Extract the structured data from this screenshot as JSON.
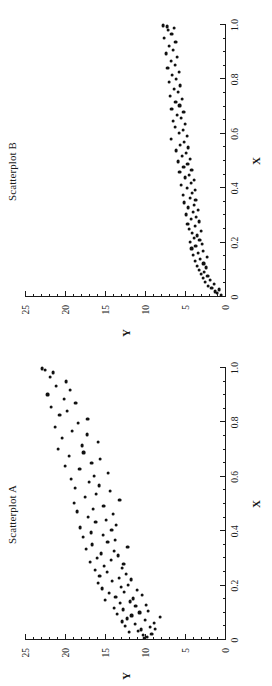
{
  "figure": {
    "background": "#ffffff",
    "ink": "#1a1a1a",
    "point_color": "#111111",
    "orientation": "rotated-90-ccw"
  },
  "panels": [
    {
      "id": "scatterplot-b",
      "title": "Scatterplot B",
      "xlabel": "X",
      "ylabel": "Y"
    },
    {
      "id": "scatterplot-a",
      "title": "Scatterplot A",
      "xlabel": "X",
      "ylabel": "Y"
    }
  ],
  "axis": {
    "x_ticklabels": [
      "0",
      "0.2",
      "0.4",
      "0.6",
      "0.8",
      "1.0"
    ],
    "x_tickvalues": [
      0,
      0.2,
      0.4,
      0.6,
      0.8,
      1.0
    ],
    "y_ticklabels": [
      "0",
      "5",
      "10",
      "15",
      "20",
      "25"
    ],
    "y_tickvalues": [
      0,
      5,
      10,
      15,
      20,
      25
    ],
    "xlim": [
      0,
      1.0
    ],
    "ylim": [
      0,
      25
    ],
    "x_minor_step": 0.05,
    "y_minor_step": 1
  },
  "chart_data": [
    {
      "type": "scatter",
      "title": "Scatterplot A",
      "xlabel": "X",
      "ylabel": "Y",
      "xlim": [
        0,
        1.0
      ],
      "ylim": [
        0,
        25
      ],
      "grid": false,
      "legend": null,
      "x": [
        0.008,
        0.012,
        0.018,
        0.022,
        0.028,
        0.033,
        0.038,
        0.041,
        0.047,
        0.052,
        0.058,
        0.062,
        0.068,
        0.073,
        0.079,
        0.084,
        0.09,
        0.095,
        0.101,
        0.107,
        0.112,
        0.118,
        0.124,
        0.129,
        0.135,
        0.141,
        0.147,
        0.152,
        0.158,
        0.164,
        0.171,
        0.177,
        0.183,
        0.189,
        0.196,
        0.203,
        0.209,
        0.216,
        0.222,
        0.229,
        0.236,
        0.243,
        0.25,
        0.257,
        0.264,
        0.272,
        0.279,
        0.287,
        0.294,
        0.302,
        0.31,
        0.318,
        0.326,
        0.334,
        0.343,
        0.351,
        0.36,
        0.368,
        0.377,
        0.386,
        0.395,
        0.404,
        0.413,
        0.423,
        0.432,
        0.442,
        0.452,
        0.462,
        0.472,
        0.482,
        0.492,
        0.503,
        0.513,
        0.524,
        0.535,
        0.546,
        0.557,
        0.568,
        0.58,
        0.591,
        0.603,
        0.615,
        0.627,
        0.639,
        0.651,
        0.664,
        0.676,
        0.689,
        0.702,
        0.715,
        0.728,
        0.742,
        0.755,
        0.769,
        0.783,
        0.797,
        0.812,
        0.826,
        0.841,
        0.856,
        0.871,
        0.886,
        0.902,
        0.918,
        0.934,
        0.95,
        0.966,
        0.983,
        0.992,
        0.998
      ],
      "y": [
        10.2,
        9.9,
        10.4,
        9.3,
        12.1,
        11.0,
        10.6,
        8.9,
        9.5,
        12.6,
        11.4,
        9.0,
        13.0,
        10.1,
        12.4,
        8.2,
        11.8,
        13.6,
        10.8,
        9.7,
        12.9,
        14.0,
        11.3,
        10.0,
        13.2,
        12.0,
        15.1,
        11.6,
        13.8,
        10.5,
        14.6,
        12.7,
        11.1,
        15.5,
        13.1,
        12.2,
        16.0,
        14.2,
        11.9,
        13.4,
        15.8,
        12.5,
        14.9,
        16.4,
        13.0,
        15.2,
        12.8,
        17.0,
        14.4,
        16.1,
        13.5,
        15.6,
        14.0,
        17.5,
        12.3,
        16.7,
        14.8,
        13.9,
        17.9,
        15.4,
        16.9,
        14.3,
        18.2,
        13.7,
        16.3,
        15.0,
        17.2,
        14.1,
        18.6,
        16.6,
        15.3,
        19.0,
        13.3,
        17.6,
        16.2,
        14.5,
        18.9,
        15.9,
        17.1,
        19.4,
        16.5,
        14.7,
        18.3,
        20.1,
        16.8,
        15.7,
        19.6,
        17.8,
        21.0,
        18.0,
        16.0,
        20.5,
        17.4,
        19.2,
        21.4,
        18.5,
        17.3,
        20.8,
        19.9,
        21.9,
        18.8,
        20.2,
        22.3,
        19.5,
        21.2,
        20.0,
        22.0,
        21.6,
        22.6,
        23.0
      ]
    },
    {
      "type": "scatter",
      "title": "Scatterplot B",
      "xlabel": "X",
      "ylabel": "Y",
      "xlim": [
        0,
        1.0
      ],
      "ylim": [
        0,
        25
      ],
      "grid": false,
      "legend": null,
      "x": [
        0.006,
        0.013,
        0.02,
        0.027,
        0.034,
        0.041,
        0.048,
        0.056,
        0.063,
        0.07,
        0.078,
        0.085,
        0.093,
        0.1,
        0.108,
        0.115,
        0.123,
        0.131,
        0.138,
        0.146,
        0.154,
        0.162,
        0.17,
        0.178,
        0.186,
        0.194,
        0.202,
        0.21,
        0.218,
        0.226,
        0.235,
        0.243,
        0.251,
        0.26,
        0.268,
        0.277,
        0.285,
        0.294,
        0.303,
        0.311,
        0.32,
        0.329,
        0.338,
        0.347,
        0.356,
        0.365,
        0.374,
        0.383,
        0.392,
        0.401,
        0.411,
        0.42,
        0.43,
        0.439,
        0.449,
        0.458,
        0.468,
        0.478,
        0.488,
        0.498,
        0.508,
        0.518,
        0.528,
        0.538,
        0.549,
        0.559,
        0.57,
        0.58,
        0.591,
        0.602,
        0.613,
        0.624,
        0.635,
        0.646,
        0.657,
        0.669,
        0.68,
        0.692,
        0.704,
        0.716,
        0.728,
        0.74,
        0.752,
        0.764,
        0.777,
        0.789,
        0.802,
        0.815,
        0.828,
        0.841,
        0.854,
        0.868,
        0.881,
        0.895,
        0.909,
        0.923,
        0.937,
        0.951,
        0.966,
        0.98,
        0.988,
        0.994,
        0.998
      ],
      "y": [
        0.6,
        1.1,
        1.4,
        0.9,
        1.8,
        2.2,
        1.5,
        2.6,
        2.0,
        2.9,
        2.3,
        3.1,
        2.7,
        3.4,
        2.5,
        3.6,
        2.8,
        3.9,
        3.2,
        2.4,
        4.1,
        3.5,
        2.9,
        4.3,
        3.8,
        3.0,
        4.5,
        3.3,
        4.0,
        3.6,
        4.2,
        3.1,
        4.6,
        3.9,
        4.8,
        3.4,
        4.4,
        3.7,
        5.0,
        4.1,
        3.5,
        4.7,
        4.0,
        5.2,
        3.8,
        4.5,
        5.4,
        4.2,
        3.9,
        4.9,
        5.6,
        4.4,
        4.0,
        5.1,
        4.6,
        5.8,
        4.3,
        5.3,
        4.8,
        6.0,
        4.5,
        5.5,
        5.0,
        6.2,
        4.7,
        5.7,
        5.2,
        6.9,
        4.9,
        5.9,
        5.4,
        6.4,
        5.1,
        6.6,
        5.6,
        6.1,
        5.3,
        6.8,
        5.8,
        6.3,
        5.5,
        7.0,
        6.0,
        6.5,
        5.7,
        7.1,
        6.2,
        6.7,
        5.9,
        7.3,
        6.4,
        6.9,
        6.1,
        7.5,
        6.6,
        7.1,
        6.3,
        7.7,
        6.8,
        7.2,
        6.5,
        7.4,
        7.9
      ]
    }
  ]
}
